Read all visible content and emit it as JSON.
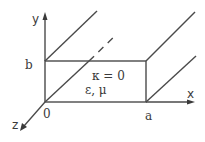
{
  "diagram": {
    "type": "rectangular-waveguide-cross-section",
    "axes": {
      "x": {
        "label": "x"
      },
      "y": {
        "label": "y"
      },
      "z": {
        "label": "z"
      }
    },
    "points": {
      "origin": {
        "label": "0"
      },
      "width": {
        "label": "a"
      },
      "height": {
        "label": "b"
      }
    },
    "interior": {
      "conductivity": "κ = 0",
      "material": "ε, μ"
    },
    "colors": {
      "line": "#4a4a4a",
      "text": "#3a3a3a",
      "background": "#ffffff"
    }
  }
}
